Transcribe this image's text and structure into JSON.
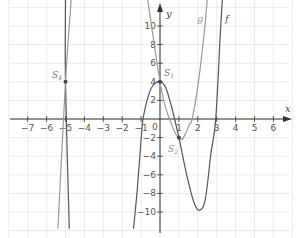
{
  "chart_data": {
    "type": "line",
    "title": "",
    "xlabel": "x",
    "ylabel": "y",
    "xlim": [
      -8,
      7
    ],
    "ylim": [
      -12,
      12.8
    ],
    "grid": true,
    "x_ticks": [
      -7,
      -6,
      -5,
      -4,
      -3,
      -2,
      -1,
      1,
      2,
      3,
      4,
      5,
      6
    ],
    "y_ticks": [
      -10,
      -8,
      -6,
      -4,
      -2,
      2,
      4,
      6,
      8,
      10
    ],
    "origin_label": "0",
    "colors": {
      "f": "#555555",
      "g": "#9a9a9a",
      "axis": "#333333",
      "grid": "#e6e6e6"
    },
    "series": [
      {
        "name": "f",
        "color": "#555555",
        "points": [
          [
            -1.4,
            -11.8
          ],
          [
            -1.2,
            -7.5
          ],
          [
            -1.0,
            -2.2
          ],
          [
            -0.9,
            0
          ],
          [
            -0.6,
            2.6
          ],
          [
            -0.3,
            3.8
          ],
          [
            0,
            4
          ],
          [
            0.3,
            3.4
          ],
          [
            0.6,
            1.4
          ],
          [
            1,
            -2
          ],
          [
            1.4,
            -5.9
          ],
          [
            1.8,
            -9.0
          ],
          [
            2.1,
            -9.8
          ],
          [
            2.4,
            -8.6
          ],
          [
            2.7,
            -3.6
          ],
          [
            2.95,
            0
          ],
          [
            3.2,
            9.5
          ],
          [
            3.3,
            12.8
          ]
        ]
      },
      {
        "name": "f_left",
        "color": "#555555",
        "points": [
          [
            -5.0,
            12.8
          ],
          [
            -5.0,
            4
          ],
          [
            -4.8,
            -11.8
          ]
        ]
      },
      {
        "name": "g",
        "color": "#9a9a9a",
        "points": [
          [
            -0.65,
            12.8
          ],
          [
            -0.3,
            8
          ],
          [
            0,
            4
          ],
          [
            0.3,
            1.2
          ],
          [
            0.6,
            -0.5
          ],
          [
            0.85,
            -1.7
          ],
          [
            1.0,
            -2
          ],
          [
            1.15,
            -2.2
          ],
          [
            1.35,
            -1.6
          ],
          [
            1.55,
            -0.6
          ],
          [
            1.7,
            0
          ],
          [
            2.0,
            3.5
          ],
          [
            2.3,
            8.5
          ],
          [
            2.5,
            12.8
          ]
        ]
      },
      {
        "name": "g_left",
        "color": "#9a9a9a",
        "points": [
          [
            -4.7,
            12.8
          ],
          [
            -5.0,
            4
          ],
          [
            -5.4,
            -11.8
          ]
        ]
      }
    ],
    "points": [
      {
        "label": "S1",
        "x": 0,
        "y": 4
      },
      {
        "label": "S2",
        "x": 1,
        "y": -2
      },
      {
        "label": "S4",
        "x": -5,
        "y": 4
      }
    ],
    "annotations": [
      {
        "text": "f",
        "x": 3.5,
        "y": 11
      },
      {
        "text": "g",
        "x": 2.0,
        "y": 11
      }
    ]
  },
  "labels": {
    "x_axis": "x",
    "y_axis": "y",
    "curve_f": "f",
    "curve_g": "g",
    "s1": "S",
    "s1_sub": "1",
    "s2": "S",
    "s2_sub": "2",
    "s4": "S",
    "s4_sub": "4",
    "origin": "0"
  }
}
